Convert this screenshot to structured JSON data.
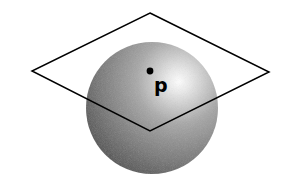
{
  "figure": {
    "point_label": "p",
    "colors": {
      "background": "#ffffff",
      "stroke": "#000000",
      "sphere_highlight": "#ffffff",
      "sphere_mid": "#9a9a9a",
      "sphere_dark": "#4a4a4a",
      "point": "#000000"
    },
    "sphere": {
      "cx": 152,
      "cy": 108,
      "r": 66
    },
    "plane": {
      "vertices": [
        {
          "name": "top",
          "x": 150,
          "y": 13
        },
        {
          "name": "right",
          "x": 269,
          "y": 72
        },
        {
          "name": "bottom",
          "x": 150,
          "y": 131
        },
        {
          "name": "left",
          "x": 32,
          "y": 71
        }
      ]
    },
    "point": {
      "x": 150,
      "y": 71,
      "r": 3.4
    },
    "label_position": {
      "x": 154,
      "y": 92
    }
  }
}
